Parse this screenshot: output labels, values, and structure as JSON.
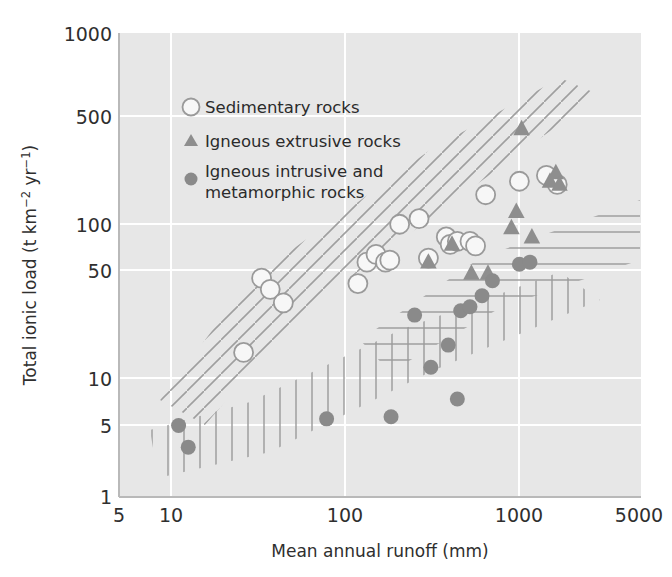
{
  "figure": {
    "background": "#ffffff",
    "plot_background": "#e7e7e7",
    "gridline_color": "#ffffff",
    "axis_color": "#b9b9b9",
    "marker_open_fill": "#f7f7f7",
    "marker_open_stroke": "#9a9a9a",
    "marker_triangle_fill": "#8e8e8e",
    "marker_filled_fill": "#8a8a8a",
    "hatch_color": "#9b9b9b"
  },
  "chart_data": {
    "type": "scatter",
    "title": "",
    "xlabel": "Mean annual runoff (mm)",
    "ylabel": "Total ionic load (t km² yr¹)",
    "ylabel_parts": {
      "lead": "Total ionic load (t km",
      "sup1": "−2",
      "mid": " yr",
      "sup2": "−1",
      "tail": ")"
    },
    "xscale": "log",
    "yscale": "log",
    "xlim": [
      5,
      5000
    ],
    "ylim": [
      1,
      1000
    ],
    "grid": true,
    "xticks": [
      5,
      10,
      100,
      1000,
      5000
    ],
    "xticklabels": [
      "5",
      "10",
      "100",
      "1000",
      "5000"
    ],
    "yticks": [
      1,
      5,
      10,
      50,
      100,
      500,
      1000
    ],
    "yticklabels": [
      "1",
      "5",
      "10",
      "50",
      "100",
      "500",
      "1000"
    ],
    "legend_position": "upper-left-inside",
    "series": [
      {
        "name": "Sedimentary rocks",
        "marker": "open-circle",
        "color": "#f7f7f7",
        "stroke": "#9a9a9a",
        "points": [
          [
            26,
            8.6
          ],
          [
            33,
            26
          ],
          [
            37,
            22
          ],
          [
            44,
            18
          ],
          [
            118,
            24
          ],
          [
            133,
            33
          ],
          [
            150,
            37
          ],
          [
            170,
            33
          ],
          [
            180,
            34
          ],
          [
            205,
            58
          ],
          [
            265,
            63
          ],
          [
            300,
            35
          ],
          [
            380,
            48
          ],
          [
            400,
            43
          ],
          [
            440,
            45
          ],
          [
            520,
            45
          ],
          [
            560,
            42
          ],
          [
            640,
            90
          ],
          [
            1000,
            110
          ],
          [
            1430,
            120
          ],
          [
            1650,
            105
          ]
        ]
      },
      {
        "name": "Igneous extrusive rocks",
        "marker": "triangle",
        "color": "#8e8e8e",
        "points": [
          [
            300,
            33
          ],
          [
            410,
            43
          ],
          [
            530,
            28
          ],
          [
            660,
            28
          ],
          [
            900,
            55
          ],
          [
            960,
            70
          ],
          [
            1030,
            240
          ],
          [
            1180,
            48
          ],
          [
            1500,
            110
          ],
          [
            1620,
            125
          ],
          [
            1700,
            105
          ]
        ]
      },
      {
        "name": "Igneous intrusive and metamorphic rocks",
        "marker": "filled-circle",
        "color": "#8a8a8a",
        "points": [
          [
            11,
            2.9
          ],
          [
            12.5,
            2.1
          ],
          [
            78,
            3.2
          ],
          [
            183,
            3.3
          ],
          [
            250,
            15
          ],
          [
            310,
            6.9
          ],
          [
            390,
            9.6
          ],
          [
            440,
            4.3
          ],
          [
            460,
            16
          ],
          [
            520,
            17
          ],
          [
            610,
            20
          ],
          [
            700,
            25
          ],
          [
            1000,
            32
          ],
          [
            1150,
            33
          ]
        ]
      }
    ],
    "hatch_zones": [
      {
        "name": "sedimentary-zone",
        "pattern": "diagonal",
        "note": "NW-SE diagonal hatch band across sedimentary field"
      },
      {
        "name": "igneous-extrusive-zone",
        "pattern": "horizontal",
        "note": "horizontal hatch band across extrusive field"
      },
      {
        "name": "igneous-intrusive-zone",
        "pattern": "vertical",
        "note": "vertical hatch band across intrusive/metamorphic field"
      }
    ]
  },
  "legend": {
    "items": [
      {
        "label": "Sedimentary rocks",
        "marker": "open-circle"
      },
      {
        "label": "Igneous extrusive rocks",
        "marker": "triangle"
      },
      {
        "label": "Igneous intrusive and",
        "label2": "metamorphic rocks",
        "marker": "filled-circle"
      }
    ]
  }
}
